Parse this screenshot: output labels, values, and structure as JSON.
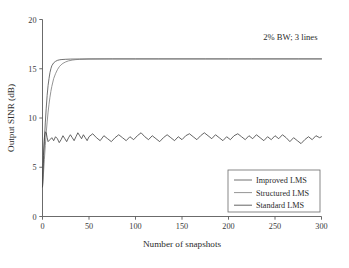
{
  "chart_data": {
    "type": "line",
    "title": "",
    "xlabel": "Number of snapshots",
    "ylabel": "Output SINR (dB)",
    "xlim": [
      0,
      300
    ],
    "ylim": [
      0,
      20
    ],
    "xticks": [
      0,
      50,
      100,
      150,
      200,
      250,
      300
    ],
    "yticks": [
      0,
      5,
      10,
      15,
      20
    ],
    "grid": false,
    "legend_position": "lower right",
    "annotations": [
      {
        "name": "bandwidth-note",
        "text": "2% BW; 3 lines",
        "x": 300,
        "y": 19
      }
    ],
    "series": [
      {
        "name": "Improved LMS",
        "color": "#4d4d4d",
        "linewidth": 0.8,
        "description": "Fast convergence to ~16 dB plateau",
        "x": [
          0,
          1,
          2,
          3,
          4,
          5,
          6,
          7,
          8,
          9,
          10,
          12,
          14,
          16,
          18,
          20,
          25,
          30,
          40,
          50,
          75,
          100,
          125,
          150,
          175,
          200,
          225,
          250,
          275,
          300
        ],
        "y": [
          3.0,
          5.4,
          7.6,
          9.5,
          11.0,
          12.3,
          13.3,
          14.0,
          14.6,
          15.0,
          15.3,
          15.6,
          15.75,
          15.85,
          15.9,
          15.93,
          15.96,
          15.98,
          15.99,
          16.0,
          16.0,
          16.0,
          16.0,
          16.0,
          16.0,
          16.0,
          16.0,
          16.0,
          16.0,
          16.0
        ]
      },
      {
        "name": "Structured LMS",
        "color": "#7a7a7a",
        "linewidth": 0.8,
        "description": "Slower convergence to same ~16 dB plateau",
        "x": [
          0,
          1,
          2,
          3,
          4,
          5,
          6,
          7,
          8,
          9,
          10,
          12,
          14,
          16,
          18,
          20,
          22,
          25,
          28,
          32,
          36,
          40,
          50,
          75,
          100,
          125,
          150,
          175,
          200,
          225,
          250,
          275,
          300
        ],
        "y": [
          3.0,
          4.3,
          5.8,
          7.2,
          8.5,
          9.6,
          10.6,
          11.4,
          12.1,
          12.7,
          13.2,
          14.0,
          14.5,
          14.9,
          15.2,
          15.4,
          15.55,
          15.7,
          15.8,
          15.88,
          15.93,
          15.95,
          15.98,
          16.0,
          16.0,
          16.0,
          16.0,
          16.0,
          16.0,
          16.0,
          16.0,
          16.0,
          16.0
        ]
      },
      {
        "name": "Standard LMS",
        "color": "#3d3d3d",
        "linewidth": 0.8,
        "description": "Rapid rise then noisy fluctuation about ~8 dB",
        "x": [
          0,
          1,
          2,
          3,
          4,
          5,
          6,
          8,
          10,
          12,
          14,
          16,
          18,
          20,
          22,
          24,
          26,
          28,
          30,
          32,
          34,
          36,
          38,
          40,
          42,
          44,
          46,
          48,
          50,
          54,
          58,
          62,
          66,
          70,
          74,
          78,
          82,
          86,
          90,
          94,
          98,
          102,
          106,
          110,
          114,
          118,
          122,
          126,
          130,
          134,
          138,
          142,
          146,
          150,
          154,
          158,
          162,
          166,
          170,
          174,
          178,
          182,
          186,
          190,
          194,
          198,
          202,
          206,
          210,
          214,
          218,
          222,
          226,
          230,
          234,
          238,
          242,
          246,
          250,
          254,
          258,
          262,
          266,
          270,
          274,
          278,
          282,
          286,
          290,
          294,
          298,
          300
        ],
        "y": [
          3.0,
          6.2,
          8.0,
          8.6,
          8.5,
          8.0,
          7.6,
          7.8,
          8.0,
          7.7,
          8.1,
          7.9,
          7.5,
          7.8,
          8.2,
          7.9,
          7.6,
          8.0,
          8.3,
          8.0,
          7.7,
          8.1,
          8.5,
          8.2,
          7.9,
          8.3,
          8.0,
          7.7,
          8.1,
          8.4,
          8.0,
          7.7,
          8.2,
          7.9,
          7.6,
          8.0,
          8.3,
          8.0,
          7.7,
          8.1,
          7.8,
          8.2,
          8.5,
          8.1,
          7.8,
          8.2,
          7.9,
          7.6,
          8.0,
          8.3,
          8.0,
          7.7,
          8.1,
          7.8,
          8.2,
          8.4,
          8.1,
          7.8,
          8.2,
          8.5,
          8.2,
          7.9,
          8.3,
          8.0,
          7.7,
          8.1,
          7.8,
          8.2,
          8.4,
          8.1,
          7.8,
          8.2,
          7.9,
          8.3,
          8.0,
          7.7,
          8.1,
          7.8,
          8.2,
          7.9,
          8.3,
          8.0,
          7.6,
          8.0,
          7.7,
          7.4,
          7.8,
          8.1,
          7.8,
          8.2,
          8.0,
          8.1
        ]
      }
    ]
  },
  "legend": {
    "items": [
      {
        "label": "Improved LMS"
      },
      {
        "label": "Structured LMS"
      },
      {
        "label": "Standard LMS"
      }
    ]
  }
}
